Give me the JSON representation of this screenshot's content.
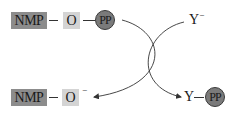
{
  "diagram": {
    "type": "chemical-reaction-scheme",
    "reactant_top": {
      "group": "NMP",
      "linker": "O",
      "leaving": "PP"
    },
    "nucleophile": {
      "label": "Y",
      "charge": "−"
    },
    "product_left": {
      "group": "NMP",
      "linker": "O",
      "charge": "−"
    },
    "product_right": {
      "label": "Y",
      "attached": "PP"
    },
    "colors": {
      "nmp_box": "#8c8c8c",
      "o_box": "#d4d4d4",
      "pp_circle": "#7a7a7a",
      "line": "#333333",
      "background": "#ffffff"
    }
  }
}
